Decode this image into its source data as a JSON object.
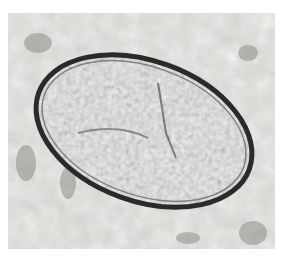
{
  "image": {
    "subject": "microscopic egg (ova) micrograph",
    "colors": {
      "background": "#d9d9d6",
      "shell": "#2a2a2a",
      "interior": "#9a9a98",
      "page": "#ffffff"
    }
  }
}
